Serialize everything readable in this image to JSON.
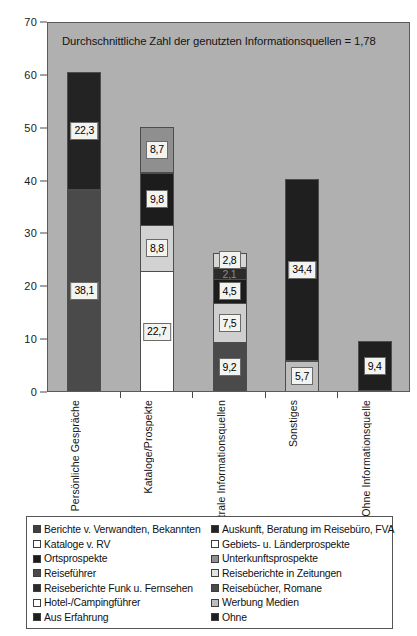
{
  "chart_data": {
    "type": "bar",
    "stacked": true,
    "title": "Durchschnittliche Zahl der genutzten Informationsquellen = 1,78",
    "xlabel": "",
    "ylabel": "",
    "ylim": [
      0,
      70
    ],
    "yticks": [
      0,
      10,
      20,
      30,
      40,
      50,
      60,
      70
    ],
    "grid": false,
    "legend_position": "bottom",
    "categories": [
      "Persönliche Gespräche",
      "Kataloge/Prospekte",
      "Neutrale Informationsquellen",
      "Sonstiges",
      "Ohne Informationsquelle"
    ],
    "bars": [
      {
        "category": "Persönliche Gespräche",
        "total": 60.4,
        "segments": [
          {
            "label": "38,1",
            "value": 38.1,
            "series": "Berichte v. Verwandten, Bekannten",
            "color": "#4a4a4a",
            "label_visible": true
          },
          {
            "label": "22,3",
            "value": 22.3,
            "series": "Auskunft, Beratung im Reisebüro, FVA",
            "color": "#232323",
            "label_visible": true
          }
        ]
      },
      {
        "category": "Kataloge/Prospekte",
        "total": 50.0,
        "segments": [
          {
            "label": "22,7",
            "value": 22.7,
            "series": "Kataloge v. RV",
            "color": "#ffffff",
            "label_visible": true
          },
          {
            "label": "8,8",
            "value": 8.8,
            "series": "Gebiets- u. Länderprospekte",
            "color": "#d2d2d2",
            "label_visible": true
          },
          {
            "label": "9,8",
            "value": 9.8,
            "series": "Ortsprospekte",
            "color": "#1c1c1c",
            "label_visible": true
          },
          {
            "label": "8,7",
            "value": 8.7,
            "series": "Unterkunftsprospekte",
            "color": "#8f8f8f",
            "label_visible": true
          }
        ]
      },
      {
        "category": "Neutrale Informationsquellen",
        "total": 26.1,
        "segments": [
          {
            "label": "9,2",
            "value": 9.2,
            "series": "Reiseführer",
            "color": "#4a4a4a",
            "label_visible": true
          },
          {
            "label": "7,5",
            "value": 7.5,
            "series": "Reiseberichte in Zeitungen",
            "color": "#cfcfcf",
            "label_visible": true
          },
          {
            "label": "4,5",
            "value": 4.5,
            "series": "Reiseberichte Funk u. Fernsehen",
            "color": "#1c1c1c",
            "label_visible": true
          },
          {
            "label": "2,1",
            "value": 2.1,
            "series": "Reisebücher, Romane",
            "color": "#2b2b2b",
            "label_visible": false
          },
          {
            "label": "2,8",
            "value": 2.8,
            "series": "Hotel-/Campingführer",
            "color": "#d6d6d6",
            "label_visible": true
          }
        ]
      },
      {
        "category": "Sonstiges",
        "total": 40.1,
        "segments": [
          {
            "label": "5,7",
            "value": 5.7,
            "series": "Werbung Medien",
            "color": "#bdbdbd",
            "label_visible": true
          },
          {
            "label": "34,4",
            "value": 34.4,
            "series": "Aus Erfahrung",
            "color": "#1f1f1f",
            "label_visible": true
          }
        ]
      },
      {
        "category": "Ohne Informationsquelle",
        "total": 9.4,
        "segments": [
          {
            "label": "9,4",
            "value": 9.4,
            "series": "Ohne",
            "color": "#1f1f1f",
            "label_visible": true
          }
        ]
      }
    ],
    "legend": [
      {
        "label": "Berichte v. Verwandten, Bekannten",
        "color": "#3f3f3f",
        "column": "left"
      },
      {
        "label": "Kataloge v. RV",
        "color": "#ffffff",
        "column": "left"
      },
      {
        "label": "Ortsprospekte",
        "color": "#1c1c1c",
        "column": "left"
      },
      {
        "label": "Reiseführer",
        "color": "#4a4a4a",
        "column": "left"
      },
      {
        "label": "Reiseberichte Funk u. Fernsehen",
        "color": "#2b2b2b",
        "column": "left"
      },
      {
        "label": "Hotel-/Campingführer",
        "color": "#ffffff",
        "column": "left"
      },
      {
        "label": "Aus Erfahrung",
        "color": "#1f1f1f",
        "column": "left"
      },
      {
        "label": "Auskunft, Beratung im Reisebüro, FVA",
        "color": "#232323",
        "column": "right"
      },
      {
        "label": "Gebiets- u. Länderprospekte",
        "color": "#ffffff",
        "column": "right"
      },
      {
        "label": "Unterkunftsprospekte",
        "color": "#8f8f8f",
        "column": "right"
      },
      {
        "label": "Reiseberichte in Zeitungen",
        "color": "#e2e2e2",
        "column": "right"
      },
      {
        "label": "Reisebücher, Romane",
        "color": "#4a4a4a",
        "column": "right"
      },
      {
        "label": "Werbung Medien",
        "color": "#bdbdbd",
        "column": "right"
      },
      {
        "label": "Ohne",
        "color": "#1f1f1f",
        "column": "right"
      }
    ]
  },
  "colors": {
    "plot_background": "#b0b0b0",
    "page_background": "#ffffff",
    "axis": "#4a4a4a",
    "text": "#141414"
  }
}
